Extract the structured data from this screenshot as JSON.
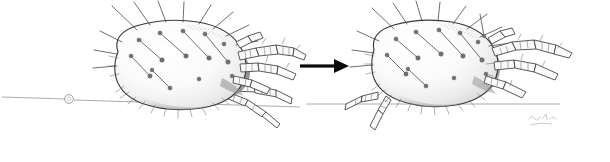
{
  "figure": {
    "title": "Mite progression illustration",
    "caption": "",
    "background_color": "#ffffff",
    "width": 610,
    "height": 162
  },
  "palette": {
    "ink_dark": "#3a3a3a",
    "ink_mid": "#5e5e5e",
    "ink_light": "#8d8d8d",
    "shade_fill": "#f2f2f2",
    "arrow_black": "#0a0a0a",
    "paper": "#ffffff"
  },
  "arrow": {
    "name": "progression-arrow",
    "direction": "right",
    "label": "",
    "shaft_start_x": 300,
    "shaft_end_x": 336,
    "tip_x": 349,
    "center_y": 66,
    "shaft_thickness": 3.2,
    "head_half_height": 7
  },
  "substrate": {
    "name": "hair-fiber-line",
    "label": "",
    "left_segment": {
      "x1": 2,
      "y1": 97,
      "x2": 66,
      "y2": 99
    },
    "right_segment": {
      "x1": 74,
      "y1": 100,
      "x2": 300,
      "y2": 107
    },
    "far_segment": {
      "x1": 330,
      "y1": 104,
      "x2": 545,
      "y2": 104
    },
    "knot": {
      "cx": 69,
      "cy": 99,
      "r": 4.4
    }
  },
  "specimens": [
    {
      "name": "mite-left",
      "position": "left",
      "stage_label": "",
      "body": {
        "cx": 182,
        "cy": 66,
        "rx": 72,
        "ry": 44,
        "rotation": -8
      },
      "seta_count": 22,
      "leg_count": 6,
      "orientation": "facing-right"
    },
    {
      "name": "mite-right",
      "position": "right",
      "stage_label": "",
      "body": {
        "cx": 437,
        "cy": 65,
        "rx": 68,
        "ry": 42,
        "rotation": -6
      },
      "seta_count": 22,
      "leg_count": 6,
      "orientation": "facing-right"
    }
  ],
  "signature": {
    "name": "artist-signature",
    "text": "",
    "x": 528,
    "y": 120,
    "legible": false
  }
}
